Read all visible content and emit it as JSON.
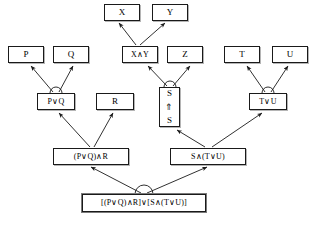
{
  "diagram": {
    "type": "tree",
    "canvas": {
      "width": 322,
      "height": 226
    },
    "colors": {
      "background": "#ffffff",
      "box_border": "#1a1a1a",
      "box_fill": "#ffffff",
      "edge": "#1a1a1a",
      "shadow": "#787878"
    },
    "nodes": [
      {
        "id": "x",
        "label": "X",
        "x": 104,
        "y": 4,
        "w": 36,
        "h": 17,
        "style": "atom"
      },
      {
        "id": "y",
        "label": "Y",
        "x": 152,
        "y": 4,
        "w": 36,
        "h": 17,
        "style": "atom"
      },
      {
        "id": "p",
        "label": "P",
        "x": 8,
        "y": 46,
        "w": 36,
        "h": 17,
        "style": "atom"
      },
      {
        "id": "q",
        "label": "Q",
        "x": 53,
        "y": 46,
        "w": 36,
        "h": 17,
        "style": "atom"
      },
      {
        "id": "xandy",
        "label": "X∧Y",
        "x": 122,
        "y": 46,
        "w": 36,
        "h": 17,
        "style": "small-formula"
      },
      {
        "id": "z",
        "label": "Z",
        "x": 167,
        "y": 46,
        "w": 36,
        "h": 17,
        "style": "atom"
      },
      {
        "id": "t",
        "label": "T",
        "x": 224,
        "y": 46,
        "w": 36,
        "h": 17,
        "style": "atom"
      },
      {
        "id": "u",
        "label": "U",
        "x": 272,
        "y": 46,
        "w": 36,
        "h": 17,
        "style": "atom"
      },
      {
        "id": "porq",
        "label": "P∨Q",
        "x": 37,
        "y": 93,
        "w": 38,
        "h": 17,
        "style": "small-formula"
      },
      {
        "id": "r",
        "label": "R",
        "x": 96,
        "y": 93,
        "w": 38,
        "h": 17,
        "style": "atom"
      },
      {
        "id": "tou",
        "label": "T∨U",
        "x": 249,
        "y": 93,
        "w": 38,
        "h": 17,
        "style": "small-formula"
      },
      {
        "id": "sbox",
        "label": "S ⇑ S",
        "x": 159,
        "y": 87,
        "w": 21,
        "h": 40,
        "style": "stacked",
        "stack": {
          "top": "S",
          "arrow": "⇑",
          "bottom": "S"
        }
      },
      {
        "id": "pqandr",
        "label": "(P∨Q)∧R",
        "x": 53,
        "y": 148,
        "w": 76,
        "h": 17,
        "style": "mid-formula"
      },
      {
        "id": "sandtu",
        "label": "S∧(T∨U)",
        "x": 170,
        "y": 148,
        "w": 76,
        "h": 17,
        "style": "mid-formula"
      },
      {
        "id": "root",
        "label": "[(P∨Q)∧R]∨[S∧(T∨U)]",
        "x": 82,
        "y": 194,
        "w": 124,
        "h": 18,
        "style": "root-formula"
      }
    ],
    "edges": [
      {
        "id": "e-xandy-x",
        "from": "xandy",
        "to": "x",
        "arrow": "to"
      },
      {
        "id": "e-xandy-y",
        "from": "xandy",
        "to": "y",
        "arrow": "to"
      },
      {
        "id": "e-porq-p",
        "from": "porq",
        "to": "p",
        "arrow": "to"
      },
      {
        "id": "e-porq-q",
        "from": "porq",
        "to": "q",
        "arrow": "to"
      },
      {
        "id": "e-sbox-xandy",
        "from": "sbox",
        "to": "xandy",
        "arrow": "to"
      },
      {
        "id": "e-sbox-z",
        "from": "sbox",
        "to": "z",
        "arrow": "to"
      },
      {
        "id": "e-tou-t",
        "from": "tou",
        "to": "t",
        "arrow": "to"
      },
      {
        "id": "e-tou-u",
        "from": "tou",
        "to": "u",
        "arrow": "to"
      },
      {
        "id": "e-pqandr-porq",
        "from": "pqandr",
        "to": "porq",
        "arrow": "to"
      },
      {
        "id": "e-pqandr-r",
        "from": "pqandr",
        "to": "r",
        "arrow": "to"
      },
      {
        "id": "e-sandtu-sbox",
        "from": "sandtu",
        "to": "sbox",
        "arrow": "to"
      },
      {
        "id": "e-sandtu-tou",
        "from": "sandtu",
        "to": "tou",
        "arrow": "to"
      },
      {
        "id": "e-root-left",
        "from": "root",
        "to": "pqandr",
        "arrow": "to"
      },
      {
        "id": "e-root-right",
        "from": "root",
        "to": "sandtu",
        "arrow": "to"
      }
    ],
    "junction_arcs": [
      {
        "id": "arc-porq",
        "at_node": "porq",
        "cx": 56,
        "cy": 93,
        "r": 6
      },
      {
        "id": "arc-sbox",
        "at_node": "sbox",
        "cx": 170,
        "cy": 87,
        "r": 6
      },
      {
        "id": "arc-tou",
        "at_node": "tou",
        "cx": 268,
        "cy": 93,
        "r": 6
      },
      {
        "id": "arc-root",
        "at_node": "root",
        "cx": 144,
        "cy": 194,
        "r": 9
      }
    ]
  }
}
